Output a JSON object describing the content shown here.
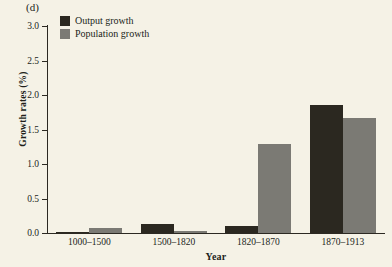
{
  "panel": {
    "label": "(d)"
  },
  "chart_data": {
    "type": "bar",
    "title": "(d)",
    "xlabel": "Year",
    "ylabel": "Growth rates (%)",
    "ylim": [
      0.0,
      3.0
    ],
    "ytick_labels": [
      "3.0",
      "2.5",
      "2.0",
      "1.5",
      "1.0",
      "0.5",
      "0.0"
    ],
    "ytick_values": [
      3.0,
      2.5,
      2.0,
      1.5,
      1.0,
      0.5,
      0.0
    ],
    "categories": [
      "1000–1500",
      "1500–1820",
      "1820–1870",
      "1870–1913"
    ],
    "grid": false,
    "legend_position": "top-left",
    "series": [
      {
        "name": "Output growth",
        "color": "#2b2820",
        "values": [
          0.02,
          0.13,
          0.1,
          1.85
        ]
      },
      {
        "name": "Population growth",
        "color": "#7b7a74",
        "values": [
          0.07,
          0.03,
          1.29,
          1.66
        ]
      }
    ]
  }
}
